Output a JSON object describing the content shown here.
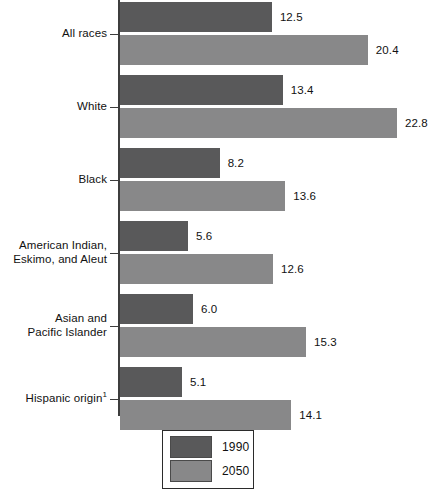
{
  "chart_data": {
    "type": "bar",
    "orientation": "horizontal",
    "title": "",
    "subtitle": "",
    "xlabel": "",
    "ylabel": "",
    "grid": false,
    "xlim": [
      0,
      26
    ],
    "legend_position": "bottom-center",
    "categories": [
      "All races",
      "White",
      "Black",
      "American Indian,\nEskimo, and Aleut",
      "Asian and\nPacific Islander",
      "Hispanic origin"
    ],
    "series": [
      {
        "name": "1990",
        "color": "#59595a",
        "values": [
          12.5,
          13.4,
          8.2,
          5.6,
          6.0,
          5.1
        ]
      },
      {
        "name": "2050",
        "color": "#888889",
        "values": [
          20.4,
          22.8,
          13.6,
          12.6,
          15.3,
          14.1
        ]
      }
    ],
    "annotations": [
      "1"
    ],
    "value_labels": [
      [
        "12.5",
        "20.4"
      ],
      [
        "13.4",
        "22.8"
      ],
      [
        "8.2",
        "13.6"
      ],
      [
        "5.6",
        "12.6"
      ],
      [
        "6.0",
        "15.3"
      ],
      [
        "5.1",
        "14.1"
      ]
    ]
  },
  "groups": [
    {
      "label_lines": [
        "All races"
      ],
      "footnote": "",
      "bars": [
        {
          "series": "1990",
          "value": 12.5,
          "value_label": "12.5"
        },
        {
          "series": "2050",
          "value": 20.4,
          "value_label": "20.4"
        }
      ]
    },
    {
      "label_lines": [
        "White"
      ],
      "footnote": "",
      "bars": [
        {
          "series": "1990",
          "value": 13.4,
          "value_label": "13.4"
        },
        {
          "series": "2050",
          "value": 22.8,
          "value_label": "22.8"
        }
      ]
    },
    {
      "label_lines": [
        "Black"
      ],
      "footnote": "",
      "bars": [
        {
          "series": "1990",
          "value": 8.2,
          "value_label": "8.2"
        },
        {
          "series": "2050",
          "value": 13.6,
          "value_label": "13.6"
        }
      ]
    },
    {
      "label_lines": [
        "American Indian,",
        "Eskimo, and Aleut"
      ],
      "footnote": "",
      "bars": [
        {
          "series": "1990",
          "value": 5.6,
          "value_label": "5.6"
        },
        {
          "series": "2050",
          "value": 12.6,
          "value_label": "12.6"
        }
      ]
    },
    {
      "label_lines": [
        "Asian and",
        "Pacific Islander"
      ],
      "footnote": "",
      "bars": [
        {
          "series": "1990",
          "value": 6.0,
          "value_label": "6.0"
        },
        {
          "series": "2050",
          "value": 15.3,
          "value_label": "15.3"
        }
      ]
    },
    {
      "label_lines": [
        "Hispanic origin"
      ],
      "footnote": "1",
      "bars": [
        {
          "series": "1990",
          "value": 5.1,
          "value_label": "5.1"
        },
        {
          "series": "2050",
          "value": 14.1,
          "value_label": "14.1"
        }
      ]
    }
  ],
  "legend": {
    "items": [
      {
        "label": "1990",
        "color": "#59595a"
      },
      {
        "label": "2050",
        "color": "#888889"
      }
    ]
  },
  "colors": {
    "series_1990": "#59595a",
    "series_2050": "#888889",
    "axis": "#3d3d3d",
    "text": "#111111",
    "background": "#ffffff"
  },
  "layout": {
    "axis_x": 120,
    "axis_top": 0,
    "axis_bottom": 416,
    "px_per_unit": 12.15,
    "bar_height": 30,
    "bar_gap": 3,
    "group_gap": 10,
    "group_top_start": 2
  }
}
